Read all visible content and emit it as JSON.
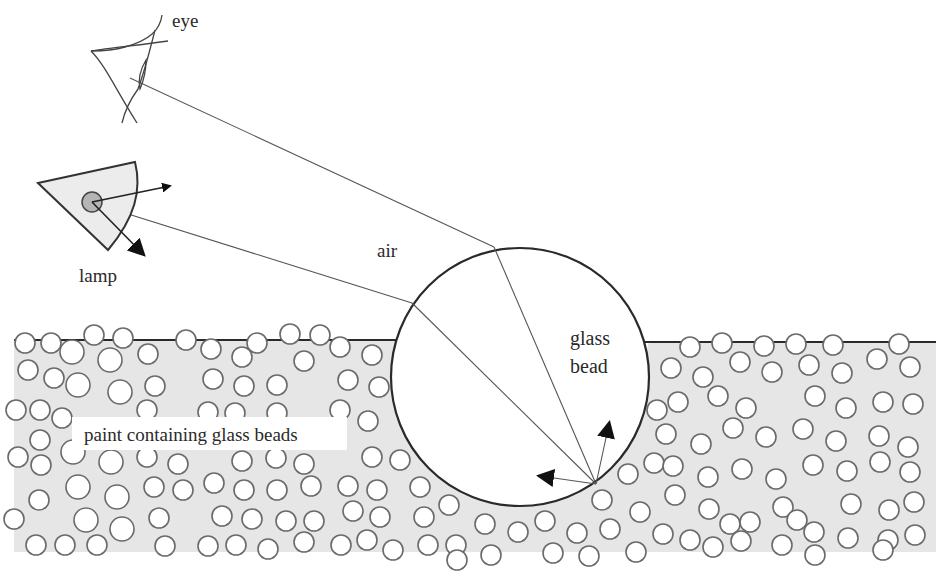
{
  "diagram": {
    "labels": {
      "eye": "eye",
      "lamp": "lamp",
      "air": "air",
      "glass_bead_line1": "glass",
      "glass_bead_line2": "bead",
      "paint": "paint containing glass beads"
    },
    "colors": {
      "paint_fill": "#e6e6e6",
      "line": "#2a2a2a",
      "bead_stroke": "#6a6a6a",
      "lamp_fill": "#ececec",
      "lamp_bulb": "#b5b5b5"
    },
    "big_bead": {
      "cx": 520,
      "cy": 377,
      "r": 129
    },
    "paint_surface_y": 340,
    "icons": [
      "eye-icon",
      "lamp-icon",
      "arrow-icon"
    ]
  }
}
